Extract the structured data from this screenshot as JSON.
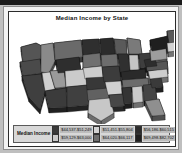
{
  "chart_data": {
    "type": "map",
    "title": "Median Income by State",
    "subtitle": "",
    "xlabel": "",
    "ylabel": "",
    "projection": "united-states-3d-extruded",
    "color_scheme": "grayscale",
    "legend": {
      "title": "Median Income",
      "position": "bottom",
      "columns": 3,
      "rows": 2,
      "bins": [
        {
          "label": "$44,537-$51,249",
          "color": "#3a3a3a",
          "order": 1
        },
        {
          "label": "$59,129-$63,000",
          "color": "#c9c9c9",
          "order": 2
        },
        {
          "label": "$51,451-$55,804",
          "color": "#d2d2d2",
          "order": 3
        },
        {
          "label": "$64,020-$66,117",
          "color": "#6e6e6e",
          "order": 4
        },
        {
          "label": "$56,186-$60,515",
          "color": "#2c2c2c",
          "order": 5
        },
        {
          "label": "$69,498-$82,702",
          "color": "#1f1f1f",
          "order": 6
        }
      ]
    },
    "states": [
      {
        "name": "Washington",
        "fill": "#555555",
        "path": "M12,26 L27,22 L33,25 L32,38 L14,41 Z"
      },
      {
        "name": "Oregon",
        "fill": "#4a4a4a",
        "path": "M11,41 L31,38 L33,52 L14,55 Z"
      },
      {
        "name": "California",
        "fill": "#3f3f3f",
        "path": "M13,55 L32,53 L36,70 L31,88 L20,76 Z"
      },
      {
        "name": "Idaho",
        "fill": "#8a8a8a",
        "path": "M32,24 L44,22 L46,40 L40,52 L32,51 Z"
      },
      {
        "name": "Nevada",
        "fill": "#cfcfcf",
        "path": "M33,52 L41,51 L46,68 L36,70 Z"
      },
      {
        "name": "Utah",
        "fill": "#9a9a9a",
        "path": "M41,50 L55,49 L57,66 L46,67 Z"
      },
      {
        "name": "Arizona",
        "fill": "#3b3b3b",
        "path": "M36,70 L57,67 L58,86 L40,87 Z"
      },
      {
        "name": "Montana",
        "fill": "#6a6a6a",
        "path": "M45,22 L72,19 L74,36 L46,39 Z"
      },
      {
        "name": "Wyoming",
        "fill": "#2e2e2e",
        "path": "M47,39 L70,36 L72,50 L49,52 Z"
      },
      {
        "name": "Colorado",
        "fill": "#cbcbcb",
        "path": "M56,50 L77,48 L78,64 L57,66 Z"
      },
      {
        "name": "New Mexico",
        "fill": "#404040",
        "path": "M58,66 L79,64 L80,84 L58,86 Z"
      },
      {
        "name": "North Dakota",
        "fill": "#2f2f2f",
        "path": "M73,19 L90,18 L91,32 L74,34 Z"
      },
      {
        "name": "South Dakota",
        "fill": "#707070",
        "path": "M74,34 L91,32 L92,45 L74,47 Z"
      },
      {
        "name": "Nebraska",
        "fill": "#cdcdcd",
        "path": "M74,47 L93,45 L94,57 L76,58 Z"
      },
      {
        "name": "Kansas",
        "fill": "#383838",
        "path": "M77,57 L96,56 L97,68 L78,69 Z"
      },
      {
        "name": "Oklahoma",
        "fill": "#616161",
        "path": "M78,69 L99,67 L100,78 L79,80 Z"
      },
      {
        "name": "Texas",
        "fill": "#c7c7c7",
        "path": "M80,79 L101,77 L105,92 L92,100 L79,92 Z"
      },
      {
        "name": "Minnesota",
        "fill": "#2b2b2b",
        "path": "M91,18 L104,17 L106,33 L92,34 Z"
      },
      {
        "name": "Iowa",
        "fill": "#6d6d6d",
        "path": "M92,34 L108,33 L109,45 L93,46 Z"
      },
      {
        "name": "Missouri",
        "fill": "#3c3c3c",
        "path": "M93,46 L110,45 L112,60 L95,61 Z"
      },
      {
        "name": "Arkansas",
        "fill": "#d0d0d0",
        "path": "M96,61 L112,60 L113,73 L99,74 Z"
      },
      {
        "name": "Louisiana",
        "fill": "#474747",
        "path": "M100,74 L114,73 L116,85 L102,86 Z"
      },
      {
        "name": "Wisconsin",
        "fill": "#5a5a5a",
        "path": "M105,18 L117,19 L118,33 L107,33 Z"
      },
      {
        "name": "Illinois",
        "fill": "#303030",
        "path": "M109,33 L119,33 L121,50 L111,51 Z"
      },
      {
        "name": "Michigan",
        "fill": "#7a7a7a",
        "path": "M118,17 L131,19 L133,33 L120,33 Z"
      },
      {
        "name": "Indiana",
        "fill": "#c4c4c4",
        "path": "M120,34 L129,34 L130,49 L121,49 Z"
      },
      {
        "name": "Ohio",
        "fill": "#3e3e3e",
        "path": "M130,33 L141,32 L142,46 L131,47 Z"
      },
      {
        "name": "Kentucky",
        "fill": "#2a2a2a",
        "path": "M112,51 L136,48 L137,57 L113,59 Z"
      },
      {
        "name": "Tennessee",
        "fill": "#6b6b6b",
        "path": "M113,59 L139,57 L140,65 L114,67 Z"
      },
      {
        "name": "Mississippi",
        "fill": "#343434",
        "path": "M113,67 L122,66 L123,82 L115,83 Z"
      },
      {
        "name": "Alabama",
        "fill": "#cacaca",
        "path": "M123,66 L133,65 L134,81 L124,82 Z"
      },
      {
        "name": "Georgia",
        "fill": "#444444",
        "path": "M134,64 L146,63 L148,79 L135,80 Z"
      },
      {
        "name": "Florida",
        "fill": "#8f8f8f",
        "path": "M136,80 L150,78 L156,94 L143,95 Z"
      },
      {
        "name": "South Carolina",
        "fill": "#3a3a3a",
        "path": "M141,58 L152,56 L154,66 L143,67 Z"
      },
      {
        "name": "North Carolina",
        "fill": "#cdcdcd",
        "path": "M139,50 L158,47 L159,56 L141,58 Z"
      },
      {
        "name": "Virginia",
        "fill": "#555555",
        "path": "M137,43 L158,40 L159,48 L138,50 Z"
      },
      {
        "name": "West Virginia",
        "fill": "#2d2d2d",
        "path": "M135,39 L146,37 L148,45 L137,46 Z"
      },
      {
        "name": "Pennsylvania",
        "fill": "#9d9d9d",
        "path": "M141,29 L157,27 L158,38 L142,40 Z"
      },
      {
        "name": "New York",
        "fill": "#1f1f1f",
        "path": "M141,19 L159,15 L161,27 L143,30 Z"
      },
      {
        "name": "Maine",
        "fill": "#595959",
        "path": "M158,10 L168,9 L169,21 L160,22 Z"
      },
      {
        "name": "New England",
        "fill": "#d2d2d2",
        "path": "M158,22 L167,21 L168,30 L159,31 Z"
      }
    ]
  },
  "frame": {
    "background": "#ffffff",
    "border_color": "#2b2b2b"
  }
}
